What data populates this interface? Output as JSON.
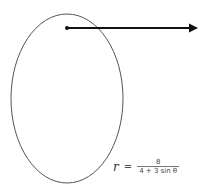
{
  "diagram": {
    "type": "polar-conic",
    "shape": "ellipse",
    "colors": {
      "curve": "#555555",
      "axis": "#111111",
      "background": "#ffffff"
    },
    "polar_axis": {
      "direction": "right",
      "origin_marker": "dot"
    },
    "equation": {
      "variable": "r",
      "equals": "=",
      "numerator": "8",
      "denominator": "4 + 3 sin θ"
    }
  }
}
